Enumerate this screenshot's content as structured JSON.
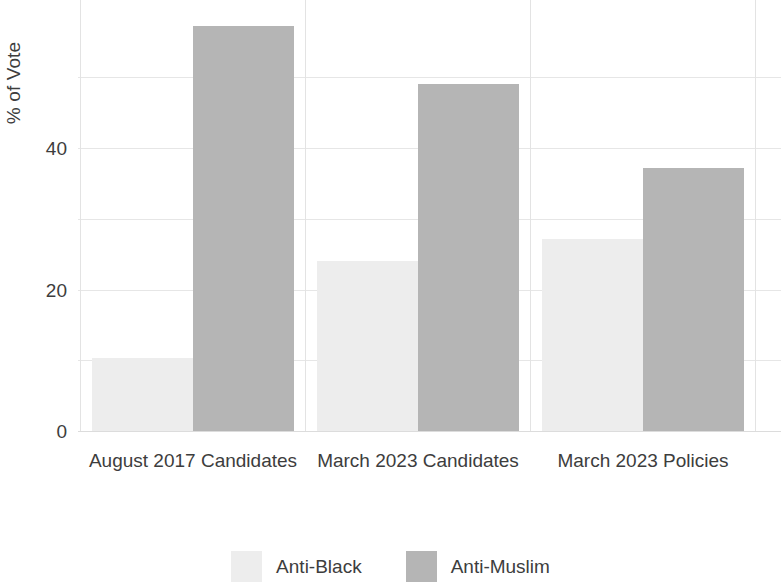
{
  "chart_data": {
    "type": "bar",
    "title": "",
    "subtitle": "",
    "xlabel": "",
    "ylabel": "% of Vote",
    "categories": [
      "August 2017 Candidates",
      "March 2023 Candidates",
      "March 2023 Policies"
    ],
    "series": [
      {
        "name": "Anti-Black",
        "color": "#ededed",
        "values": [
          10.3,
          24.1,
          27.2
        ]
      },
      {
        "name": "Anti-Muslim",
        "color": "#b5b5b5",
        "values": [
          57.3,
          49.0,
          37.2
        ]
      }
    ],
    "ylim": [
      0,
      58
    ],
    "yticks": [
      0,
      20,
      40
    ],
    "ytick_labels": [
      "0",
      "20",
      "40"
    ],
    "gridlines": [
      0,
      10,
      20,
      30,
      40,
      50
    ],
    "grid": true,
    "grid_color": "#e6e6e6",
    "legend_position": "bottom",
    "background": "#ffffff",
    "text_color": "#3d3d3d"
  },
  "axis": {
    "y_title": "% of Vote",
    "y_tick_0": "0",
    "y_tick_20": "20",
    "y_tick_40": "40"
  },
  "x_axis": {
    "labels": [
      "August 2017 Candidates",
      "March 2023 Candidates",
      "March 2023 Policies"
    ]
  },
  "legend": {
    "items": [
      {
        "label": "Anti-Black",
        "color": "#ededed"
      },
      {
        "label": "Anti-Muslim",
        "color": "#b5b5b5"
      }
    ]
  }
}
